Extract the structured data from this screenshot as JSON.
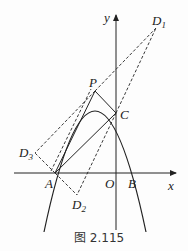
{
  "figure": {
    "caption": "图 2.115",
    "axes": {
      "x_label": "x",
      "y_label": "y",
      "origin_label": "O"
    },
    "points": {
      "A": {
        "label": "A",
        "x": 55,
        "y": 173
      },
      "B": {
        "label": "B",
        "x": 136,
        "y": 173
      },
      "C": {
        "label": "C",
        "x": 116,
        "y": 113
      },
      "P": {
        "label": "P",
        "x": 95,
        "y": 91
      },
      "D1": {
        "label": "D",
        "sub": "1",
        "x": 156,
        "y": 28
      },
      "D2": {
        "label": "D",
        "sub": "2",
        "x": 77,
        "y": 195
      },
      "D3": {
        "label": "D",
        "sub": "3",
        "x": 35,
        "y": 153
      }
    },
    "colors": {
      "stroke": "#222222",
      "background": "#fdfdfd"
    }
  }
}
